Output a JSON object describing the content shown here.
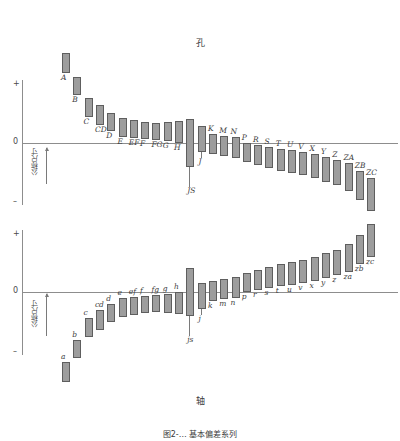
{
  "figure": {
    "caption": "图2-… 基本偏差系列",
    "hole_title": "孔",
    "shaft_title": "轴",
    "axis": {
      "plus": "+",
      "minus": "–",
      "zero": "0",
      "nominal_size": "公称尺寸"
    },
    "colors": {
      "bar_fill": "#9d9d9d",
      "bar_stroke": "#5e5e5e",
      "axis": "#8d8d8d",
      "text": "#3a3a3a"
    }
  },
  "chart_data": [
    {
      "type": "bar",
      "title": "孔",
      "subtitle": "Hole fundamental deviations",
      "xlabel": "",
      "ylabel": "公称尺寸",
      "ylim": [
        -1,
        1
      ],
      "grid": false,
      "legend": "none",
      "note": "Bars are tolerance zones; top/bottom given as relative deviation units about the zero line.",
      "categories": [
        "A",
        "B",
        "C",
        "CD",
        "D",
        "E",
        "EF",
        "F",
        "FG",
        "G",
        "H",
        "JS",
        "J",
        "K",
        "M",
        "N",
        "P",
        "R",
        "S",
        "T",
        "U",
        "V",
        "X",
        "Y",
        "Z",
        "ZA",
        "ZB",
        "ZC"
      ],
      "bars": [
        {
          "label": "A",
          "top": 0.98,
          "bottom": 0.76,
          "label_pos": "below"
        },
        {
          "label": "B",
          "top": 0.72,
          "bottom": 0.52,
          "label_pos": "below"
        },
        {
          "label": "C",
          "top": 0.49,
          "bottom": 0.28,
          "label_pos": "below"
        },
        {
          "label": "CD",
          "top": 0.41,
          "bottom": 0.2,
          "label_pos": "below"
        },
        {
          "label": "D",
          "top": 0.33,
          "bottom": 0.13,
          "label_pos": "below"
        },
        {
          "label": "E",
          "top": 0.27,
          "bottom": 0.07,
          "label_pos": "below"
        },
        {
          "label": "EF",
          "top": 0.25,
          "bottom": 0.05,
          "label_pos": "below"
        },
        {
          "label": "F",
          "top": 0.23,
          "bottom": 0.04,
          "label_pos": "below"
        },
        {
          "label": "FG",
          "top": 0.22,
          "bottom": 0.03,
          "label_pos": "below"
        },
        {
          "label": "G",
          "top": 0.23,
          "bottom": 0.02,
          "label_pos": "below"
        },
        {
          "label": "H",
          "top": 0.24,
          "bottom": 0.0,
          "label_pos": "below"
        },
        {
          "label": "JS",
          "top": 0.26,
          "bottom": -0.26,
          "label_pos": "leader-below"
        },
        {
          "label": "J",
          "top": 0.18,
          "bottom": -0.1,
          "label_pos": "leader-below"
        },
        {
          "label": "K",
          "top": 0.1,
          "bottom": -0.12,
          "label_pos": "above"
        },
        {
          "label": "M",
          "top": 0.08,
          "bottom": -0.14,
          "label_pos": "above"
        },
        {
          "label": "N",
          "top": 0.06,
          "bottom": -0.16,
          "label_pos": "above"
        },
        {
          "label": "P",
          "top": 0.0,
          "bottom": -0.21,
          "label_pos": "above"
        },
        {
          "label": "R",
          "top": -0.02,
          "bottom": -0.24,
          "label_pos": "above"
        },
        {
          "label": "S",
          "top": -0.04,
          "bottom": -0.27,
          "label_pos": "above"
        },
        {
          "label": "T",
          "top": -0.06,
          "bottom": -0.3,
          "label_pos": "above"
        },
        {
          "label": "U",
          "top": -0.08,
          "bottom": -0.33,
          "label_pos": "above"
        },
        {
          "label": "V",
          "top": -0.1,
          "bottom": -0.35,
          "label_pos": "above"
        },
        {
          "label": "X",
          "top": -0.12,
          "bottom": -0.38,
          "label_pos": "above"
        },
        {
          "label": "Y",
          "top": -0.15,
          "bottom": -0.42,
          "label_pos": "above"
        },
        {
          "label": "Z",
          "top": -0.18,
          "bottom": -0.46,
          "label_pos": "above"
        },
        {
          "label": "ZA",
          "top": -0.22,
          "bottom": -0.52,
          "label_pos": "above"
        },
        {
          "label": "ZB",
          "top": -0.3,
          "bottom": -0.62,
          "label_pos": "above"
        },
        {
          "label": "ZC",
          "top": -0.38,
          "bottom": -0.74,
          "label_pos": "above"
        }
      ]
    },
    {
      "type": "bar",
      "title": "轴",
      "subtitle": "Shaft fundamental deviations",
      "xlabel": "",
      "ylabel": "公称尺寸",
      "ylim": [
        -1,
        1
      ],
      "grid": false,
      "legend": "none",
      "note": "Mirror of the hole diagram; lowercase letters denote shaft basic deviations.",
      "categories": [
        "a",
        "b",
        "c",
        "cd",
        "d",
        "e",
        "ef",
        "f",
        "fg",
        "g",
        "h",
        "js",
        "j",
        "k",
        "m",
        "n",
        "p",
        "r",
        "s",
        "t",
        "u",
        "v",
        "x",
        "y",
        "z",
        "za",
        "zb",
        "zc"
      ],
      "bars": [
        {
          "label": "a",
          "top": -0.76,
          "bottom": -0.98,
          "label_pos": "above"
        },
        {
          "label": "b",
          "top": -0.52,
          "bottom": -0.72,
          "label_pos": "above"
        },
        {
          "label": "c",
          "top": -0.28,
          "bottom": -0.49,
          "label_pos": "above"
        },
        {
          "label": "cd",
          "top": -0.2,
          "bottom": -0.41,
          "label_pos": "above"
        },
        {
          "label": "d",
          "top": -0.13,
          "bottom": -0.33,
          "label_pos": "above"
        },
        {
          "label": "e",
          "top": -0.07,
          "bottom": -0.27,
          "label_pos": "above"
        },
        {
          "label": "ef",
          "top": -0.05,
          "bottom": -0.25,
          "label_pos": "above"
        },
        {
          "label": "f",
          "top": -0.04,
          "bottom": -0.23,
          "label_pos": "above"
        },
        {
          "label": "fg",
          "top": -0.03,
          "bottom": -0.22,
          "label_pos": "above"
        },
        {
          "label": "g",
          "top": -0.02,
          "bottom": -0.23,
          "label_pos": "above"
        },
        {
          "label": "h",
          "top": 0.0,
          "bottom": -0.24,
          "label_pos": "above"
        },
        {
          "label": "js",
          "top": 0.26,
          "bottom": -0.26,
          "label_pos": "leader-below"
        },
        {
          "label": "j",
          "top": 0.1,
          "bottom": -0.18,
          "label_pos": "leader-below"
        },
        {
          "label": "k",
          "top": 0.12,
          "bottom": -0.1,
          "label_pos": "below"
        },
        {
          "label": "m",
          "top": 0.14,
          "bottom": -0.08,
          "label_pos": "below"
        },
        {
          "label": "n",
          "top": 0.16,
          "bottom": -0.06,
          "label_pos": "below"
        },
        {
          "label": "p",
          "top": 0.21,
          "bottom": 0.0,
          "label_pos": "below"
        },
        {
          "label": "r",
          "top": 0.24,
          "bottom": 0.02,
          "label_pos": "below"
        },
        {
          "label": "s",
          "top": 0.27,
          "bottom": 0.04,
          "label_pos": "below"
        },
        {
          "label": "t",
          "top": 0.3,
          "bottom": 0.06,
          "label_pos": "below"
        },
        {
          "label": "u",
          "top": 0.33,
          "bottom": 0.08,
          "label_pos": "below"
        },
        {
          "label": "v",
          "top": 0.35,
          "bottom": 0.1,
          "label_pos": "below"
        },
        {
          "label": "x",
          "top": 0.38,
          "bottom": 0.12,
          "label_pos": "below"
        },
        {
          "label": "y",
          "top": 0.42,
          "bottom": 0.15,
          "label_pos": "below"
        },
        {
          "label": "z",
          "top": 0.46,
          "bottom": 0.18,
          "label_pos": "below"
        },
        {
          "label": "za",
          "top": 0.52,
          "bottom": 0.22,
          "label_pos": "below"
        },
        {
          "label": "zb",
          "top": 0.62,
          "bottom": 0.3,
          "label_pos": "below"
        },
        {
          "label": "zc",
          "top": 0.74,
          "bottom": 0.38,
          "label_pos": "below"
        }
      ]
    }
  ]
}
